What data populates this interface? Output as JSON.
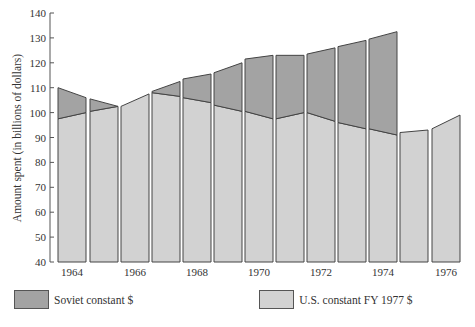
{
  "chart_data": {
    "type": "bar",
    "title": "",
    "xlabel": "",
    "ylabel": "Amount spent (in billions of dollars)",
    "ylim": [
      40,
      140
    ],
    "yticks": [
      40,
      50,
      60,
      70,
      80,
      90,
      100,
      110,
      120,
      130,
      140
    ],
    "xtick_labels": [
      "1964",
      "1966",
      "1968",
      "1970",
      "1972",
      "1974",
      "1976"
    ],
    "categories": [
      "1964",
      "1965",
      "1966",
      "1967",
      "1968",
      "1969",
      "1970",
      "1971",
      "1972",
      "1973",
      "1974",
      "1975",
      "1976"
    ],
    "bar_shape": "trapezoid tops (start-of-year to end-of-year values)",
    "series": [
      {
        "name": "Soviet constant $",
        "color": "#a3a3a3",
        "start": [
          110,
          105.5,
          null,
          108.5,
          113.5,
          116,
          121.5,
          123,
          123.5,
          126.5,
          129.5,
          null,
          null
        ],
        "end": [
          106,
          102.5,
          null,
          112.5,
          115.5,
          120,
          123,
          123,
          126,
          129,
          132.5,
          null,
          null
        ]
      },
      {
        "name": "U.S. constant FY 1977 $",
        "color": "#d2d2d2",
        "start": [
          97.5,
          100.5,
          102.5,
          108,
          106,
          103,
          100.5,
          97.5,
          100,
          96,
          93.5,
          92,
          93.5
        ],
        "end": [
          100,
          102.5,
          107.5,
          106.5,
          104,
          100.5,
          97.5,
          100,
          96.5,
          93.5,
          91,
          93,
          99
        ]
      }
    ],
    "grid": false,
    "legend_position": "bottom"
  },
  "legend": {
    "soviet": {
      "label": "Soviet constant $",
      "color": "#a3a3a3"
    },
    "us": {
      "label": "U.S. constant FY 1977 $",
      "color": "#d2d2d2"
    }
  }
}
